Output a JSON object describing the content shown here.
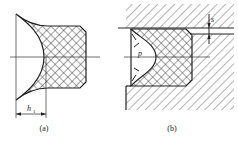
{
  "figure": {
    "panels": [
      {
        "id": "a",
        "caption": "(a)",
        "dimension_label": "h",
        "dimension_subscript": "1"
      },
      {
        "id": "b",
        "caption": "(b)",
        "pressure_label": "p",
        "gap_label": "s"
      }
    ],
    "colors": {
      "line": "#222222",
      "background": "#ffffff"
    }
  }
}
